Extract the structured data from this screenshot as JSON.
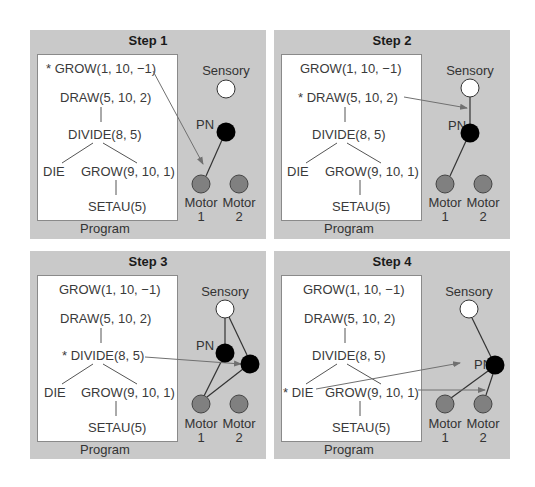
{
  "panels": [
    {
      "title": "Step 1",
      "program_label": "Program",
      "statements": {
        "grow1": "* GROW(1, 10, −1)",
        "draw": "DRAW(5, 10, 2)",
        "divide": "DIVIDE(8, 5)",
        "die": "DIE",
        "grow2": "GROW(9, 10, 1)",
        "setau": "SETAU(5)"
      },
      "nodes": {
        "sensory": "Sensory",
        "pn": "PN",
        "motor1_a": "Motor",
        "motor1_b": "1",
        "motor2_a": "Motor",
        "motor2_b": "2"
      }
    },
    {
      "title": "Step 2",
      "program_label": "Program",
      "statements": {
        "grow1": "GROW(1, 10, −1)",
        "draw": "* DRAW(5, 10, 2)",
        "divide": "DIVIDE(8, 5)",
        "die": "DIE",
        "grow2": "GROW(9, 10, 1)",
        "setau": "SETAU(5)"
      },
      "nodes": {
        "sensory": "Sensory",
        "pn": "PN",
        "motor1_a": "Motor",
        "motor1_b": "1",
        "motor2_a": "Motor",
        "motor2_b": "2"
      }
    },
    {
      "title": "Step 3",
      "program_label": "Program",
      "statements": {
        "grow1": "GROW(1, 10, −1)",
        "draw": "DRAW(5, 10, 2)",
        "divide": "* DIVIDE(8, 5)",
        "die": "DIE",
        "grow2": "GROW(9, 10, 1)",
        "setau": "SETAU(5)"
      },
      "nodes": {
        "sensory": "Sensory",
        "pn": "PN",
        "motor1_a": "Motor",
        "motor1_b": "1",
        "motor2_a": "Motor",
        "motor2_b": "2"
      }
    },
    {
      "title": "Step 4",
      "program_label": "Program",
      "statements": {
        "grow1": "GROW(1, 10, −1)",
        "draw": "DRAW(5, 10, 2)",
        "divide": "DIVIDE(8, 5)",
        "die": "* DIE",
        "grow2": "GROW(9, 10, 1)",
        "setau": "SETAU(5)"
      },
      "nodes": {
        "sensory": "Sensory",
        "pn": "PN",
        "motor1_a": "Motor",
        "motor1_b": "1",
        "motor2_a": "Motor",
        "motor2_b": "2"
      }
    }
  ],
  "colors": {
    "panel_bg": "#c9c9c9",
    "program_bg": "#ffffff",
    "sensory_node": "#ffffff",
    "pn_node": "#000000",
    "motor_node": "#808080",
    "arrow": "#707070"
  }
}
